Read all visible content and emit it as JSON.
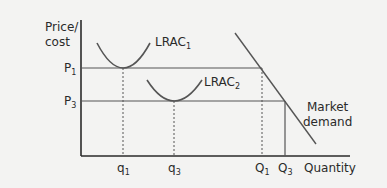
{
  "diagram": {
    "type": "economics-cost-curves",
    "y_axis_label_line1": "Price/",
    "y_axis_label_line2": "cost",
    "x_axis_label": "Quantity",
    "price_levels": [
      {
        "name": "P",
        "sub": "1"
      },
      {
        "name": "P",
        "sub": "3"
      }
    ],
    "firm_quantities": [
      {
        "name": "q",
        "sub": "1"
      },
      {
        "name": "q",
        "sub": "3"
      }
    ],
    "market_quantities": [
      {
        "name": "Q",
        "sub": "1"
      },
      {
        "name": "Q",
        "sub": "3"
      }
    ],
    "curves": {
      "lrac1": {
        "name": "LRAC",
        "sub": "1"
      },
      "lrac2": {
        "name": "LRAC",
        "sub": "2"
      },
      "demand_line1": "Market",
      "demand_line2": "demand"
    },
    "colors": {
      "background": "#f3f3f2",
      "axis": "#2a2a2a",
      "curve": "#555555",
      "text": "#2a2a2a"
    }
  }
}
